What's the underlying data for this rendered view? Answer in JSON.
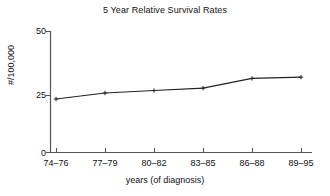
{
  "chart_data": {
    "type": "line",
    "title": "5 Year Relative Survival Rates",
    "xlabel": "years (of diagnosis)",
    "ylabel": "#/100,000",
    "categories": [
      "74–76",
      "77–79",
      "80–82",
      "83–85",
      "86–88",
      "89–95"
    ],
    "values": [
      22,
      24.5,
      25.5,
      26.5,
      30.5,
      31
    ],
    "yticks": [
      0,
      25,
      50
    ],
    "ytick_labels": [
      "0",
      "25",
      "50"
    ],
    "ylim": [
      0,
      50
    ],
    "grid": false,
    "legend": false,
    "marker": "plus",
    "line_color": "#222222",
    "axis_color": "#555555",
    "background_color": "#ffffff"
  },
  "axes": {
    "x_tick_labels": [
      "74–76",
      "77–79",
      "80–82",
      "83–85",
      "86–88",
      "89–95"
    ],
    "y_tick_labels": [
      "0",
      "25",
      "50"
    ]
  }
}
